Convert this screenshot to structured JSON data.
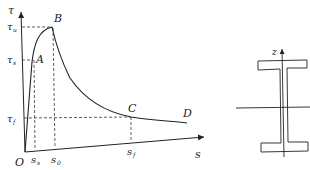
{
  "diagram": {
    "type": "stress-slip curve with I-section",
    "axes": {
      "y_label": "τ",
      "x_label": "s",
      "origin_label": "O"
    },
    "points": [
      {
        "id": "A",
        "label": "A"
      },
      {
        "id": "B",
        "label": "B"
      },
      {
        "id": "C",
        "label": "C"
      },
      {
        "id": "D",
        "label": "D"
      }
    ],
    "y_ticks": [
      {
        "name": "tau-u",
        "main": "τ",
        "sub": "u"
      },
      {
        "name": "tau-s",
        "main": "τ",
        "sub": "s"
      },
      {
        "name": "tau-f",
        "main": "τ",
        "sub": "f"
      }
    ],
    "x_ticks": [
      {
        "name": "s-s",
        "main": "s",
        "sub": "s"
      },
      {
        "name": "s-0",
        "main": "s",
        "sub": "0"
      },
      {
        "name": "s-f",
        "main": "s",
        "sub": "f"
      }
    ],
    "section": {
      "axis_label": "z",
      "shape": "I-beam"
    }
  }
}
